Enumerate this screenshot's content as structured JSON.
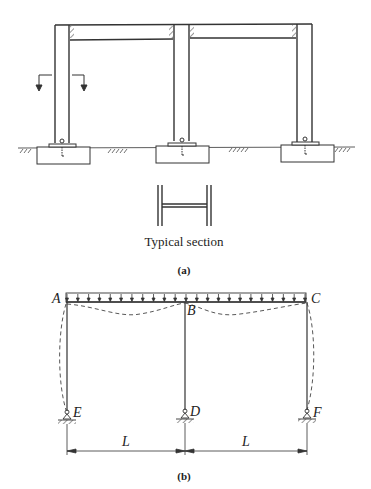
{
  "figure_a": {
    "caption": "(a)",
    "section_label": "Typical section",
    "description": "Two-bay steel portal frame on concrete footings with section cut arrows"
  },
  "figure_b": {
    "caption": "(b)",
    "joints": {
      "A": "A",
      "B": "B",
      "C": "C",
      "D": "D",
      "E": "E",
      "F": "F"
    },
    "span_left": "L",
    "span_right": "L",
    "load": "uniform distributed load",
    "deflected_shape": "dashed"
  },
  "colors": {
    "line": "#333333",
    "background": "#ffffff"
  }
}
